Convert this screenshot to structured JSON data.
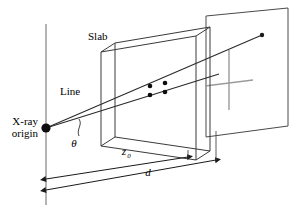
{
  "figure": {
    "background_color": "#ffffff",
    "stroke_color": "#1a1a1a",
    "gray_color": "#8c8c8c",
    "labels": {
      "slab": "Slab",
      "line": "Line",
      "xray_origin_line1": "X-ray",
      "xray_origin_line2": "origin",
      "theta": "θ",
      "z_zero_base": "z",
      "z_zero_subscript": "0",
      "distance_d": "d"
    },
    "geometry": {
      "origin_point": {
        "x": 46,
        "y": 128
      },
      "vertical_axis": {
        "x": 46,
        "y_top": 24,
        "y_bottom": 205
      },
      "ray_upper_end": {
        "x": 262,
        "y": 35
      },
      "ray_lower_end": {
        "x": 219,
        "y": 74
      },
      "slab_front_face": [
        {
          "x": 101,
          "y": 52
        },
        {
          "x": 101,
          "y": 146
        },
        {
          "x": 196,
          "y": 160
        },
        {
          "x": 196,
          "y": 36
        }
      ],
      "slab_thickness_offset": {
        "dx": 14,
        "dy": -9
      },
      "detector_plane": [
        {
          "x": 206,
          "y": 16
        },
        {
          "x": 288,
          "y": 8
        },
        {
          "x": 288,
          "y": 126
        },
        {
          "x": 206,
          "y": 137
        }
      ],
      "intersection_dots": [
        {
          "x": 150,
          "y": 86
        },
        {
          "x": 165,
          "y": 83
        },
        {
          "x": 150,
          "y": 95
        },
        {
          "x": 165,
          "y": 92
        }
      ],
      "dimension_z0": {
        "x_start": 46,
        "y_start": 179,
        "x_end": 188,
        "y_end": 157
      },
      "dimension_d": {
        "x_start": 46,
        "y_start": 190,
        "x_end": 216,
        "y_end": 160
      },
      "detector_cross_vertical": {
        "x": 229,
        "y_top": 50,
        "y_bottom": 110
      },
      "detector_cross_horizontal": {
        "x_left": 205,
        "y_left": 86,
        "x_right": 253,
        "y_right": 80
      }
    }
  }
}
